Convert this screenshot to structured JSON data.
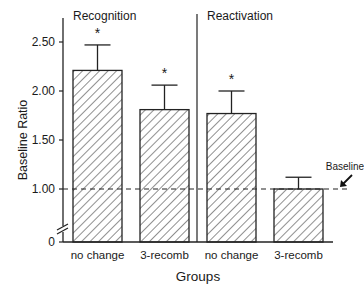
{
  "chart_data": {
    "type": "bar",
    "title": "",
    "xlabel": "Groups",
    "ylabel": "Baseline Ratio",
    "ylim": [
      0,
      2.75
    ],
    "axis_break": true,
    "yticks": [
      {
        "value": 0,
        "label": "0"
      },
      {
        "value": 1.0,
        "label": "1.00"
      },
      {
        "value": 1.5,
        "label": "1.50"
      },
      {
        "value": 2.0,
        "label": "2.00"
      },
      {
        "value": 2.5,
        "label": "2.50"
      }
    ],
    "panels": [
      {
        "label": "Recognition",
        "bar_indices": [
          0,
          1
        ]
      },
      {
        "label": "Reactivation",
        "bar_indices": [
          2,
          3
        ]
      }
    ],
    "categories": [
      "no change",
      "3-recomb",
      "no change",
      "3-recomb"
    ],
    "values": [
      2.21,
      1.81,
      1.77,
      1.0
    ],
    "error_upper": [
      2.47,
      2.06,
      2.0,
      1.12
    ],
    "significance": [
      "*",
      "*",
      "*",
      ""
    ],
    "fill": "diagonal-hatch",
    "baseline": {
      "value": 1.0,
      "label": "Baseline",
      "style": "dashed"
    },
    "grid": false,
    "legend": "none"
  }
}
